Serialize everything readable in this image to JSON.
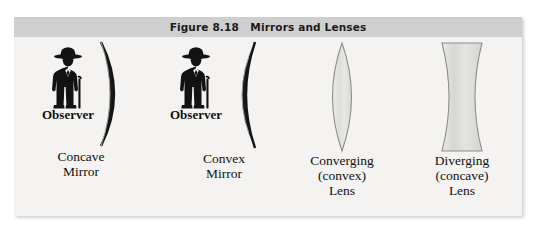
{
  "figure": {
    "title": "Figure 8.18   Mirrors and Lenses",
    "background_color": "#f4f3f1",
    "title_bar_color": "#cfcfcf",
    "items": [
      {
        "id": "concave-mirror",
        "observer_label": "Observer",
        "caption": "Concave\nMirror",
        "shape": "crescent-opening-left",
        "has_observer": true
      },
      {
        "id": "convex-mirror",
        "observer_label": "Observer",
        "caption": "Convex\nMirror",
        "shape": "crescent-opening-right",
        "has_observer": true
      },
      {
        "id": "converging-lens",
        "observer_label": "",
        "caption": "Converging\n(convex)\nLens",
        "shape": "biconvex-lens",
        "has_observer": false,
        "fill_color": "#e3e3e1",
        "stroke_color": "#8a8a88"
      },
      {
        "id": "diverging-lens",
        "observer_label": "",
        "caption": "Diverging\n(concave)\nLens",
        "shape": "biconcave-lens",
        "has_observer": false,
        "fill_color": "#dededc",
        "stroke_color": "#8a8a88"
      }
    ]
  }
}
